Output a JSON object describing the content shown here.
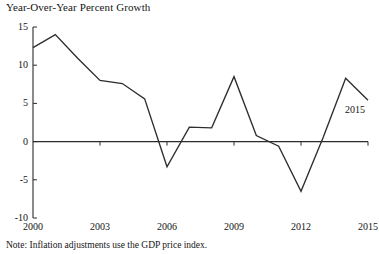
{
  "chart_data": {
    "type": "line",
    "title": "Year-Over-Year Percent Growth",
    "note": "Note: Inflation adjustments use the GDP price index.",
    "series_annotation": "2015",
    "xlabel": "",
    "ylabel": "",
    "grid": false,
    "legend": "none",
    "xlim": [
      2000,
      2015
    ],
    "ylim": [
      -10,
      15
    ],
    "ytick_labels": [
      "15",
      "10",
      "5",
      "0",
      "-5",
      "-10"
    ],
    "ytick_values": [
      15,
      10,
      5,
      0,
      -5,
      -10
    ],
    "xtick_labels": [
      "2000",
      "2003",
      "2006",
      "2009",
      "2012",
      "2015"
    ],
    "xtick_values": [
      2000,
      2003,
      2006,
      2009,
      2012,
      2015
    ],
    "x": [
      2000,
      2001,
      2002,
      2003,
      2004,
      2005,
      2006,
      2007,
      2008,
      2009,
      2010,
      2011,
      2012,
      2013,
      2014,
      2015
    ],
    "values": [
      12.3,
      14.0,
      10.9,
      8.0,
      7.6,
      5.6,
      -3.3,
      1.9,
      1.8,
      8.5,
      0.8,
      -0.6,
      -6.5,
      0.6,
      8.3,
      5.4
    ],
    "series": [
      {
        "name": "Year-Over-Year Percent Growth",
        "values": [
          12.3,
          14.0,
          10.9,
          8.0,
          7.6,
          5.6,
          -3.3,
          1.9,
          1.8,
          8.5,
          0.8,
          -0.6,
          -6.5,
          0.6,
          8.3,
          5.4
        ],
        "color": "#2e2e2e"
      }
    ],
    "zero_line": 0,
    "colors": {
      "line": "#2e2e2e",
      "axis": "#2b2b2b",
      "text": "#151515",
      "background": "#ffffff"
    }
  }
}
